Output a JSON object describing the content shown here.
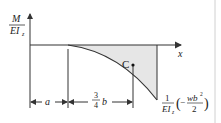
{
  "diagram": {
    "type": "moment-curvature diagram",
    "y_axis_label": {
      "numerator": "M",
      "denominator": "EI",
      "denominator_sub": "z"
    },
    "x_axis_label": "x",
    "point_label": "C",
    "end_value_label": {
      "coef_numerator": "1",
      "coef_denominator": "EI",
      "coef_denominator_sub": "z",
      "paren_open": "(",
      "minus": "−",
      "frac_numerator": "wb",
      "frac_numerator_sup": "2",
      "frac_denominator": "2",
      "paren_close": ")"
    },
    "dimensions": [
      {
        "label": "a"
      },
      {
        "label_numerator": "3",
        "label_denominator": "4",
        "label_var": "b"
      }
    ],
    "colors": {
      "line": "#333333",
      "fill": "#e6e6e6",
      "frame": "#d0d0d0"
    }
  }
}
